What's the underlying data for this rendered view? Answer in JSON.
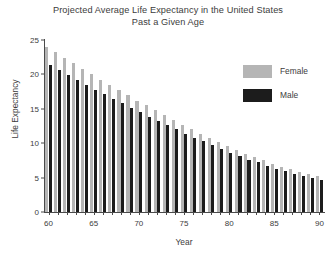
{
  "chart_data": {
    "type": "bar",
    "title": "Projected Average Life Expectancy in the United States Past a Given Age",
    "title_lines": [
      "Projected Average Life Expectancy in the United States",
      "Past a Given Age"
    ],
    "xlabel": "Year",
    "ylabel": "Life Expectancy",
    "xlim": [
      59.5,
      90.5
    ],
    "ylim": [
      0,
      25
    ],
    "yticks": [
      0,
      5,
      10,
      15,
      20,
      25
    ],
    "xticks": [
      60,
      65,
      70,
      75,
      80,
      85,
      90
    ],
    "grid": false,
    "legend_position": "upper right",
    "categories": [
      60,
      61,
      62,
      63,
      64,
      65,
      66,
      67,
      68,
      69,
      70,
      71,
      72,
      73,
      74,
      75,
      76,
      77,
      78,
      79,
      80,
      81,
      82,
      83,
      84,
      85,
      86,
      87,
      88,
      89,
      90
    ],
    "series": [
      {
        "name": "Female",
        "color": "#b5b5b5",
        "values": [
          24.0,
          23.2,
          22.4,
          21.6,
          20.8,
          20.0,
          19.2,
          18.5,
          17.7,
          17.0,
          16.2,
          15.5,
          14.8,
          14.1,
          13.4,
          12.7,
          12.1,
          11.4,
          10.8,
          10.2,
          9.6,
          9.0,
          8.5,
          8.0,
          7.5,
          7.0,
          6.6,
          6.2,
          5.8,
          5.5,
          5.2
        ]
      },
      {
        "name": "Male",
        "color": "#1c1c1c",
        "values": [
          21.3,
          20.6,
          19.9,
          19.2,
          18.5,
          17.8,
          17.1,
          16.4,
          15.8,
          15.1,
          14.5,
          13.8,
          13.2,
          12.6,
          12.0,
          11.4,
          10.8,
          10.3,
          9.7,
          9.2,
          8.6,
          8.1,
          7.6,
          7.2,
          6.7,
          6.3,
          5.9,
          5.5,
          5.2,
          4.9,
          4.6
        ]
      }
    ]
  },
  "legend": {
    "entries": [
      {
        "label": "Female",
        "color": "#b5b5b5"
      },
      {
        "label": "Male",
        "color": "#1c1c1c"
      }
    ]
  }
}
